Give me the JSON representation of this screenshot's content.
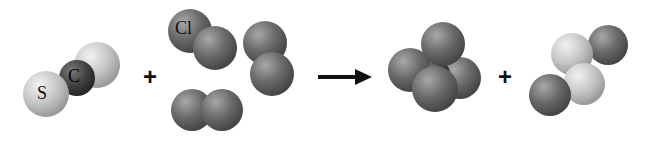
{
  "equation": {
    "reactants": [
      {
        "name": "carbon-disulfide",
        "atoms": [
          "S",
          "C",
          "S"
        ],
        "labels": {
          "sulfur": "S",
          "carbon": "C"
        }
      },
      {
        "name": "chlorine-molecules",
        "count": 3,
        "label": "Cl"
      }
    ],
    "products": [
      {
        "name": "carbon-tetrachloride"
      },
      {
        "name": "disulfur-dichloride"
      }
    ],
    "plus_sign": "+",
    "arrow": "→"
  },
  "colors": {
    "sulfur": "#c8c8c8",
    "carbon": "#3c3c3c",
    "chlorine": "#6a6a6a",
    "background": "#ffffff"
  }
}
